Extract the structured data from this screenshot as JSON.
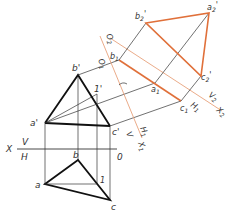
{
  "colors": {
    "thick_line": "#111111",
    "thin_line": "#333333",
    "orange_thick": "#e0703a",
    "orange_thin": "#e8a27c",
    "background": "#ffffff"
  },
  "labels": {
    "b_prime": "b'",
    "a_prime": "a'",
    "c_prime": "c'",
    "one_prime": "1'",
    "b": "b",
    "a": "a",
    "c": "c",
    "one": "1",
    "X": "X",
    "V": "V",
    "H": "H",
    "O": "0",
    "b1": "b1",
    "a1": "a1",
    "c1": "c1",
    "b2_prime": "b2'",
    "a2_prime": "a2'",
    "c2_prime": "c2'",
    "O1": "O1",
    "O2": "O2",
    "V1_axis": "V",
    "H1_axis": "H1",
    "X1": "X1",
    "H1_right": "H1",
    "V2": "V2",
    "X2": "X2"
  }
}
